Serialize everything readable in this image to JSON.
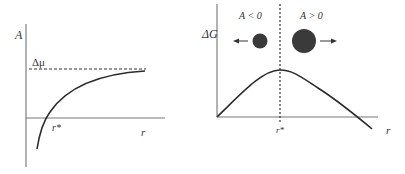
{
  "left_panel": {
    "y_axis_label": "A",
    "asymptote_label": "Δμ",
    "crossing_label": "r*",
    "x_axis_label": "r"
  },
  "right_panel": {
    "y_axis_label": "ΔG",
    "region_left_label": "A < 0",
    "region_right_label": "A > 0",
    "critical_label": "r*",
    "x_axis_label": "r"
  },
  "colors": {
    "line": "#2b2b2b",
    "particle": "#3a3a3a",
    "axis": "#777777"
  }
}
